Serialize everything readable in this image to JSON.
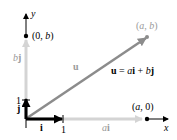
{
  "diagram": {
    "axes": {
      "x_label": "x",
      "y_label": "y",
      "x_tick": "1",
      "y_tick": "1"
    },
    "points": {
      "ab": "(a, b)",
      "a0": "(a, 0)",
      "zero_b": "(0, b)"
    },
    "vectors": {
      "u_label": "u",
      "i_label": "i",
      "j_label": "j",
      "ai_label_coef": "a",
      "ai_label_vec": "i",
      "bj_label_coef": "b",
      "bj_label_vec": "j"
    },
    "equation": {
      "lhs": "u",
      "eq": " = ",
      "a": "a",
      "i": "i",
      "plus": " + ",
      "b": "b",
      "j": "j"
    },
    "colors": {
      "axis": "#000000",
      "unit_vectors": "#000000",
      "u_vector": "#8c8c8c",
      "component_vectors": "#d4d4d4",
      "faded_label": "#9a9a9a"
    }
  }
}
